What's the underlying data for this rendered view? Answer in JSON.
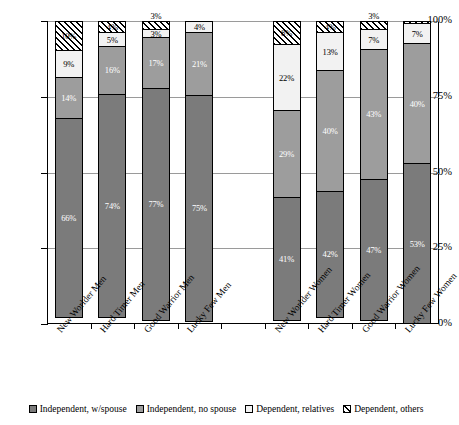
{
  "chart_data": {
    "type": "bar",
    "subtype": "stacked-100-percent",
    "title": "",
    "xlabel": "",
    "ylabel": "",
    "ylim": [
      0,
      100
    ],
    "yticks": [
      "0%",
      "25%",
      "50%",
      "75%",
      "100%"
    ],
    "ytick_values": [
      0,
      25,
      50,
      75,
      100
    ],
    "grid": true,
    "legend_position": "bottom",
    "categories": [
      "New Worlder Men",
      "Hard Timer Men",
      "Good Warrior Men",
      "Lucky Few Men",
      "New Worlder Women",
      "Hard Timer Women",
      "Good Warrior Women",
      "Lucky Few Women"
    ],
    "group_gap_after_index": 3,
    "series": [
      {
        "name": "Independent, w/spouse",
        "fill": "solid-dark-gray",
        "color": "#7b7b7b",
        "values": [
          66,
          74,
          77,
          75,
          41,
          42,
          47,
          53
        ],
        "labels": [
          "66%",
          "74%",
          "77%",
          "75%",
          "41%",
          "42%",
          "47%",
          "53%"
        ],
        "label_color": "#ffffff",
        "label_outside": [
          false,
          false,
          false,
          false,
          false,
          false,
          false,
          false
        ]
      },
      {
        "name": "Independent, no spouse",
        "fill": "dotted-medium-gray",
        "color": "#9d9d9d",
        "values": [
          14,
          16,
          17,
          21,
          29,
          40,
          43,
          40
        ],
        "labels": [
          "14%",
          "16%",
          "17%",
          "21%",
          "29%",
          "40%",
          "43%",
          "40%"
        ],
        "label_color": "#ffffff",
        "label_outside": [
          false,
          false,
          false,
          false,
          false,
          false,
          false,
          false
        ]
      },
      {
        "name": "Dependent, relatives",
        "fill": "dotted-light",
        "color": "#f2f2f2",
        "values": [
          9,
          5,
          3,
          4,
          22,
          13,
          7,
          7
        ],
        "labels": [
          "9%",
          "5%",
          "3%",
          "4%",
          "22%",
          "13%",
          "7%",
          "7%"
        ],
        "label_color": "#000000",
        "label_outside": [
          false,
          false,
          false,
          false,
          false,
          false,
          false,
          false
        ]
      },
      {
        "name": "Dependent, others",
        "fill": "diagonal-hatch",
        "color": "#ffffff",
        "values": [
          10,
          4,
          3,
          0,
          8,
          4,
          3,
          1
        ],
        "labels": [
          "10%",
          "4%",
          "3%",
          "",
          "8%",
          "4%",
          "3%",
          ""
        ],
        "label_color": "#000000",
        "label_outside": [
          false,
          false,
          true,
          false,
          false,
          false,
          true,
          false
        ]
      }
    ]
  },
  "legend": {
    "items": [
      {
        "label": "Independent, w/spouse"
      },
      {
        "label": "Independent, no spouse"
      },
      {
        "label": "Dependent, relatives"
      },
      {
        "label": "Dependent, others"
      }
    ]
  }
}
